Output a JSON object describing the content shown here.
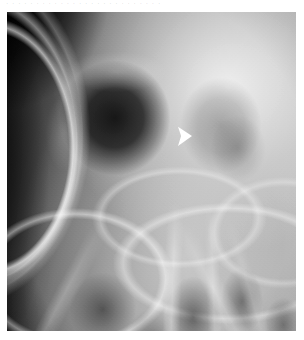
{
  "page": {
    "background_color": "#ffffff",
    "width": 304,
    "height": 340
  },
  "caption_remnant": {
    "text": "· · ·   · · · · ·   · ·   · · · ·   · · ·   · · · ·   · ·   · · ·",
    "note": "faint cropped text baseline at top of page, illegible"
  },
  "radiograph": {
    "modality": "x-ray",
    "view": "skull / paranasal sinus radiograph",
    "frame": {
      "left": 7,
      "top": 12,
      "width": 289,
      "height": 319
    },
    "tone": {
      "darkest": "#111111",
      "mid": "#8a8a8a",
      "lightest": "#c8c8c8",
      "marker_color": "#ffffff"
    },
    "regions": [
      {
        "name": "soft-tissue-dark-corner",
        "position": "upper-left",
        "tone": "very dark"
      },
      {
        "name": "calvarial-arc-lines",
        "position": "left lateral",
        "tone": "bright curved bands"
      },
      {
        "name": "left-orbit",
        "position": "center-left",
        "tone": "dark rounded cavity"
      },
      {
        "name": "right-orbit",
        "position": "center-right",
        "tone": "faint, opacified"
      },
      {
        "name": "ethmoid-midline",
        "position": "center",
        "tone": "mid gray"
      },
      {
        "name": "maxillary-sinuses",
        "position": "lower half",
        "tone": "dark pockets"
      },
      {
        "name": "facial-bone-trabeculae",
        "position": "bottom",
        "tone": "bright struts"
      }
    ]
  },
  "marker": {
    "type": "arrowhead",
    "label": "lesion-pointer",
    "color": "#ffffff",
    "direction": "right",
    "position": {
      "x": 178,
      "y": 126,
      "width": 14,
      "height": 20
    },
    "points_at": "medial orbital wall / ethmoid region"
  }
}
